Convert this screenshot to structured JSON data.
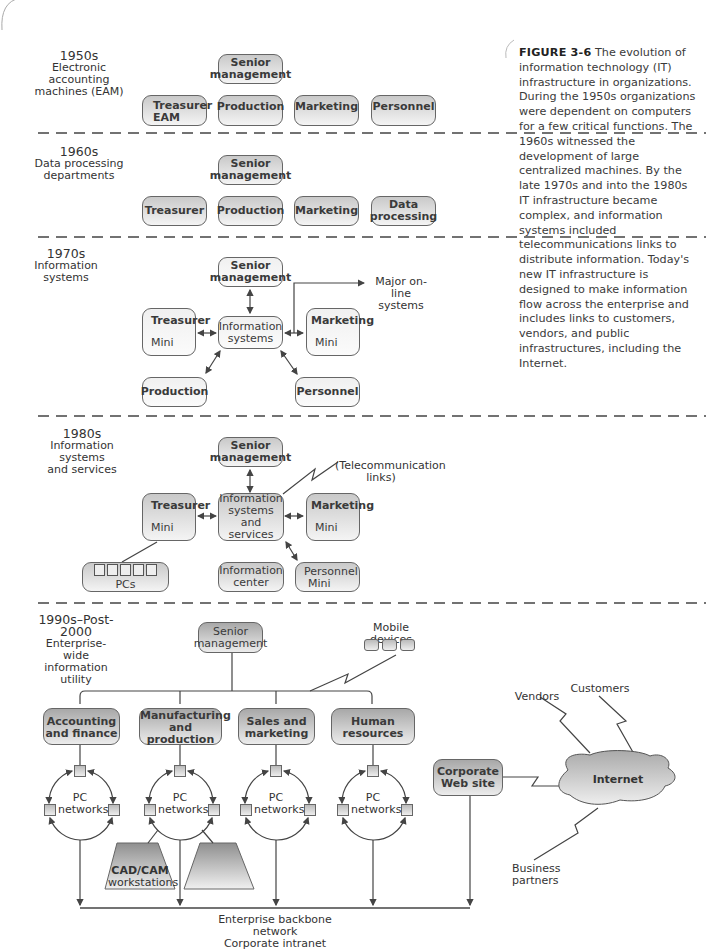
{
  "caption": {
    "figure_label": "FIGURE 3-6",
    "text": "The evolution of information technology (IT) infrastructure in organizations. During the 1950s organizations were dependent on computers for a few critical functions. The 1960s witnessed the development of large centralized machines. By the late 1970s and into the 1980s IT infrastructure became complex, and information systems included telecommunications links to distribute information. Today's new IT infrastructure is designed to make information flow across the enterprise and includes links to customers, vendors, and public infrastructures, including the Internet."
  },
  "eras": [
    {
      "year": "1950s",
      "title_lines": [
        "Electronic",
        "accounting",
        "machines (EAM)"
      ],
      "boxes": {
        "senior": [
          "Senior",
          "management"
        ],
        "treasurer": [
          "Treasurer",
          "EAM"
        ],
        "production": "Production",
        "marketing": "Marketing",
        "personnel": "Personnel"
      }
    },
    {
      "year": "1960s",
      "title_lines": [
        "Data processing",
        "departments"
      ],
      "boxes": {
        "senior": [
          "Senior",
          "management"
        ],
        "treasurer": "Treasurer",
        "production": "Production",
        "marketing": "Marketing",
        "data_processing": [
          "Data",
          "processing"
        ]
      }
    },
    {
      "year": "1970s",
      "title_lines": [
        "Information",
        "systems"
      ],
      "boxes": {
        "senior": [
          "Senior",
          "management"
        ],
        "treasurer": [
          "Treasurer",
          "Mini"
        ],
        "info_systems": [
          "Information",
          "systems"
        ],
        "marketing": [
          "Marketing",
          "Mini"
        ],
        "production": "Production",
        "personnel": "Personnel"
      },
      "labels": {
        "online": [
          "Major on-line",
          "systems"
        ]
      }
    },
    {
      "year": "1980s",
      "title_lines": [
        "Information systems",
        "and services"
      ],
      "boxes": {
        "senior": [
          "Senior",
          "management"
        ],
        "treasurer": [
          "Treasurer",
          "Mini"
        ],
        "info_systems": [
          "Information",
          "systems and",
          "services"
        ],
        "marketing": [
          "Marketing",
          "Mini"
        ],
        "pcs": "PCs",
        "info_center": [
          "Information",
          "center"
        ],
        "personnel": [
          "Personnel",
          "Mini"
        ]
      },
      "labels": {
        "telecom": [
          "(Telecommunication",
          "links)"
        ]
      }
    },
    {
      "year": "1990s–Post-2000",
      "title_lines": [
        "Enterprise-wide",
        "information",
        "utility"
      ],
      "boxes": {
        "senior": [
          "Senior",
          "management"
        ],
        "accounting": [
          "Accounting",
          "and finance"
        ],
        "manufacturing": [
          "Manufacturing",
          "and production"
        ],
        "sales": [
          "Sales and",
          "marketing"
        ],
        "hr": "Human resources",
        "web": [
          "Corporate",
          "Web site"
        ],
        "internet": "Internet"
      },
      "labels": {
        "mobile": "Mobile devices",
        "pc_networks": [
          "PC",
          "networks"
        ],
        "cadcam": [
          "CAD/CAM",
          "workstations"
        ],
        "vendors": "Vendors",
        "customers": "Customers",
        "partners": [
          "Business",
          "partners"
        ],
        "backbone": [
          "Enterprise backbone network",
          "Corporate intranet"
        ]
      }
    }
  ]
}
